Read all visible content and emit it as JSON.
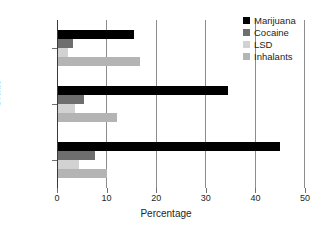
{
  "chart_data": {
    "type": "bar",
    "orientation": "horizontal",
    "title": "",
    "xlabel": "Percentage",
    "ylabel": "Grade",
    "categories": [
      "8th",
      "10th",
      "12th"
    ],
    "xlim": [
      0,
      50
    ],
    "xticks": [
      0,
      10,
      20,
      30,
      40,
      50
    ],
    "xtick_labels": [
      "0",
      "10",
      "20",
      "30",
      "40",
      "50"
    ],
    "grid": true,
    "legend_position": "top-right",
    "series": [
      {
        "name": "Marijuana",
        "color": "#000000",
        "values": [
          15.5,
          34.5,
          45.0
        ]
      },
      {
        "name": "Cocaine",
        "color": "#6e6e6e",
        "values": [
          3.2,
          5.4,
          7.7
        ]
      },
      {
        "name": "LSD",
        "color": "#d2d2d2",
        "values": [
          2.2,
          3.6,
          4.5
        ]
      },
      {
        "name": "Inhalants",
        "color": "#b4b4b4",
        "values": [
          16.7,
          12.0,
          10.0
        ]
      }
    ]
  }
}
